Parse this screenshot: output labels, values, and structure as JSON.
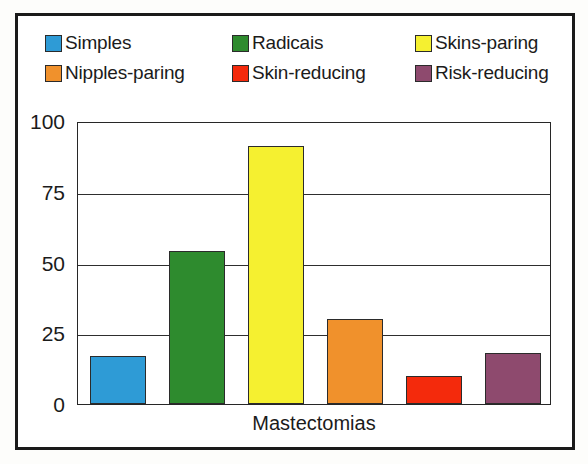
{
  "chart_data": {
    "type": "bar",
    "title": "",
    "xlabel": "Mastectomias",
    "ylabel": "",
    "categories": [
      "Simples",
      "Radicais",
      "Skins-paring",
      "Nipples-paring",
      "Skin-reducing",
      "Risk-reducing"
    ],
    "values": [
      17,
      54,
      91,
      30,
      10,
      18
    ],
    "colors": [
      "#2E9BD6",
      "#2E8B2E",
      "#F5F030",
      "#F0912C",
      "#F42A0C",
      "#8E4A6E"
    ],
    "ylim": [
      0,
      100
    ],
    "yticks": [
      0,
      25,
      50,
      75,
      100
    ],
    "ytick_labels": [
      "0",
      "25",
      "50",
      "75",
      "100"
    ],
    "grid": true,
    "legend_position": "top"
  },
  "legend": {
    "rows": [
      [
        {
          "label": "Simples",
          "color": "#2E9BD6"
        },
        {
          "label": "Radicais",
          "color": "#2E8B2E"
        },
        {
          "label": "Skins-paring",
          "color": "#F5F030"
        }
      ],
      [
        {
          "label": "Nipples-paring",
          "color": "#F0912C"
        },
        {
          "label": "Skin-reducing",
          "color": "#F42A0C"
        },
        {
          "label": "Risk-reducing",
          "color": "#8E4A6E"
        }
      ]
    ]
  },
  "axis": {
    "x_title": "Mastectomias",
    "y_labels": [
      "100",
      "75",
      "50",
      "25",
      "0"
    ]
  },
  "style": {
    "frame_color": "#1a1a1a",
    "grid_color": "#2e2e2e",
    "text_color": "#1b1b1b",
    "background": "#ffffff"
  }
}
